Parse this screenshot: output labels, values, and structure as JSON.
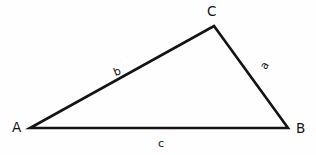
{
  "figure": {
    "kind": "triangle-diagram",
    "width": 316,
    "height": 155,
    "background_color": "#fefefe",
    "stroke_color": "#141414",
    "stroke_width": 2.6,
    "text_color": "#141414"
  },
  "vertices": [
    {
      "id": "A",
      "label": "A",
      "x": 30,
      "y": 128,
      "label_x": 12,
      "label_y": 121
    },
    {
      "id": "B",
      "label": "B",
      "x": 288,
      "y": 128,
      "label_x": 296,
      "label_y": 122
    },
    {
      "id": "C",
      "label": "C",
      "x": 214,
      "y": 26,
      "label_x": 207,
      "label_y": 5
    }
  ],
  "sides": [
    {
      "id": "a",
      "label": "a",
      "from": "B",
      "to": "C",
      "label_x": 258,
      "label_y": 66,
      "rotation": -62
    },
    {
      "id": "b",
      "label": "b",
      "from": "A",
      "to": "C",
      "label_x": 112,
      "label_y": 68,
      "rotation": -22
    },
    {
      "id": "c",
      "label": "c",
      "from": "A",
      "to": "B",
      "label_x": 158,
      "label_y": 138,
      "rotation": 0
    }
  ],
  "chart_data": {
    "type": "diagram",
    "title": "",
    "shape": "triangle",
    "points": {
      "A": [
        30,
        128
      ],
      "B": [
        288,
        128
      ],
      "C": [
        214,
        26
      ]
    },
    "vertex_labels": [
      "A",
      "B",
      "C"
    ],
    "side_labels": [
      "a",
      "b",
      "c"
    ],
    "side_mapping": {
      "a": "BC",
      "b": "AC",
      "c": "AB"
    }
  }
}
